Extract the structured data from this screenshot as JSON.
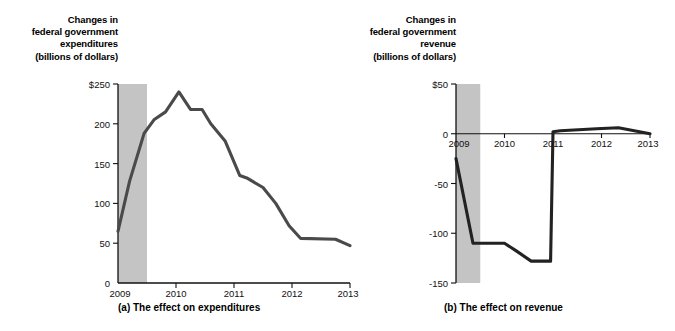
{
  "figure": {
    "panels": [
      {
        "id": "a",
        "caption": "(a) The effect on expenditures",
        "axis_title": "Changes in\nfederal government\nexpenditures\n(billions of dollars)",
        "y_ticks": [
          "$250",
          "200",
          "150",
          "100",
          "50",
          "0"
        ],
        "x_ticks": [
          "2009",
          "2010",
          "2011",
          "2012",
          "2013"
        ]
      },
      {
        "id": "b",
        "caption": "(b) The effect on revenue",
        "axis_title": "Changes in\nfederal government\nrevenue\n(billions of dollars)",
        "y_ticks": [
          "$50",
          "0",
          "-50",
          "-100",
          "-150"
        ],
        "x_ticks": [
          "2009",
          "2010",
          "2011",
          "2012",
          "2013"
        ]
      }
    ]
  },
  "chart_data": [
    {
      "type": "line",
      "panel": "a",
      "title": "Changes in federal government expenditures (billions of dollars)",
      "caption": "(a) The effect on expenditures",
      "xlabel": "",
      "ylabel": "Changes in federal government expenditures (billions of dollars)",
      "ylim": [
        0,
        250
      ],
      "xlim": [
        2009,
        2013
      ],
      "yticks": [
        0,
        50,
        100,
        150,
        200,
        250
      ],
      "ytick_labels": [
        "0",
        "50",
        "100",
        "150",
        "200",
        "$250"
      ],
      "xticks": [
        2009,
        2010,
        2011,
        2012,
        2013
      ],
      "xtick_labels": [
        "2009",
        "2010",
        "2011",
        "2012",
        "2013"
      ],
      "grid": false,
      "legend": "none",
      "line_color": "#4a4a4a",
      "shaded_band": {
        "label": "recession",
        "x_start": 2009.0,
        "x_end": 2009.5,
        "color": "#c4c4c4"
      },
      "x": [
        2009.0,
        2009.25,
        2009.5,
        2009.75,
        2010.0,
        2010.25,
        2010.5,
        2010.75,
        2011.0,
        2011.25,
        2011.5,
        2011.75,
        2012.0,
        2012.25,
        2012.5,
        2012.75,
        2013.0
      ],
      "values": [
        65,
        128,
        188,
        205,
        215,
        240,
        218,
        218,
        200,
        178,
        135,
        132,
        120,
        100,
        72,
        56,
        55,
        47
      ],
      "series": [
        {
          "name": "Changes in federal government expenditures",
          "x": [
            2009.0,
            2009.2,
            2009.45,
            2009.62,
            2009.82,
            2010.05,
            2010.25,
            2010.45,
            2010.6,
            2010.85,
            2011.1,
            2011.22,
            2011.5,
            2011.72,
            2011.95,
            2012.15,
            2012.75,
            2013.0
          ],
          "values": [
            65,
            128,
            188,
            205,
            215,
            240,
            218,
            218,
            200,
            178,
            135,
            132,
            120,
            100,
            72,
            56,
            55,
            47
          ]
        }
      ]
    },
    {
      "type": "line",
      "panel": "b",
      "title": "Changes in federal government revenue (billions of dollars)",
      "caption": "(b) The effect on revenue",
      "xlabel": "",
      "ylabel": "Changes in federal government revenue (billions of dollars)",
      "ylim": [
        -150,
        50
      ],
      "xlim": [
        2009,
        2013
      ],
      "yticks": [
        -150,
        -100,
        -50,
        0,
        50
      ],
      "ytick_labels": [
        "-150",
        "-100",
        "-50",
        "0",
        "$50"
      ],
      "xticks": [
        2009,
        2010,
        2011,
        2012,
        2013
      ],
      "xtick_labels": [
        "2009",
        "2010",
        "2011",
        "2012",
        "2013"
      ],
      "grid": false,
      "legend": "none",
      "line_color": "#222222",
      "shaded_band": {
        "label": "recession",
        "x_start": 2009.0,
        "x_end": 2009.5,
        "color": "#c4c4c4"
      },
      "x": [
        2009.0,
        2009.35,
        2009.55,
        2010.0,
        2010.25,
        2010.55,
        2010.95,
        2011.0,
        2011.15,
        2011.9,
        2012.35,
        2013.0
      ],
      "values": [
        -25,
        -110,
        -110,
        -110,
        -118,
        -128,
        -128,
        2,
        3,
        5,
        6,
        0
      ],
      "series": [
        {
          "name": "Changes in federal government revenue",
          "x": [
            2009.0,
            2009.35,
            2009.55,
            2010.0,
            2010.25,
            2010.55,
            2010.95,
            2011.0,
            2011.15,
            2011.9,
            2012.35,
            2013.0
          ],
          "values": [
            -25,
            -110,
            -110,
            -110,
            -118,
            -128,
            -128,
            2,
            3,
            5,
            6,
            0
          ]
        }
      ]
    }
  ]
}
